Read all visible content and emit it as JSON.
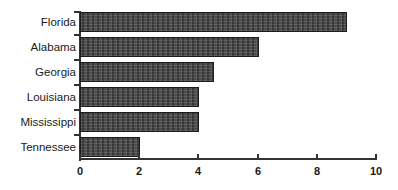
{
  "chart_data": {
    "type": "bar",
    "orientation": "horizontal",
    "title": "",
    "subtitle": "",
    "xlabel": "",
    "ylabel": "",
    "categories": [
      "Florida",
      "Alabama",
      "Georgia",
      "Louisiana",
      "Mississippi",
      "Tennessee"
    ],
    "values": [
      9,
      6,
      4.5,
      4,
      4,
      2
    ],
    "xlim": [
      0,
      10
    ],
    "xticks": [
      0,
      2,
      4,
      6,
      8,
      10
    ],
    "xtick_labels": [
      "0",
      "2",
      "4",
      "6",
      "8",
      "10"
    ],
    "grid": false,
    "legend": false,
    "legend_position": "none",
    "series": [
      {
        "name": "",
        "values": [
          9,
          6,
          4.5,
          4,
          4,
          2
        ]
      }
    ],
    "bar_fill_color": "#4a4a4a",
    "bar_edge_color": "#1c1c1c",
    "axis_color": "#333333",
    "text_color": "#1a1a1a",
    "background_color": "#ffffff"
  },
  "axes": {
    "x_ticks": [
      {
        "label": "0",
        "value": 0
      },
      {
        "label": "2",
        "value": 2
      },
      {
        "label": "4",
        "value": 4
      },
      {
        "label": "6",
        "value": 6
      },
      {
        "label": "8",
        "value": 8
      },
      {
        "label": "10",
        "value": 10
      }
    ]
  },
  "bars": [
    {
      "label": "Florida",
      "value": 9
    },
    {
      "label": "Alabama",
      "value": 6
    },
    {
      "label": "Georgia",
      "value": 4.5
    },
    {
      "label": "Louisiana",
      "value": 4
    },
    {
      "label": "Mississippi",
      "value": 4
    },
    {
      "label": "Tennessee",
      "value": 2
    }
  ]
}
